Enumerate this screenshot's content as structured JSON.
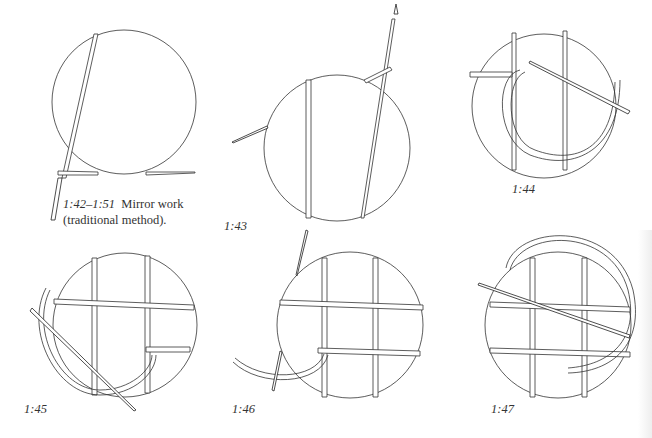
{
  "caption": {
    "figure_range": "1:42–1:51",
    "title_line1": "Mirror work",
    "title_line2": "(traditional method)."
  },
  "figures": [
    {
      "id": "1:42",
      "label": ""
    },
    {
      "id": "1:43",
      "label": "1:43"
    },
    {
      "id": "1:44",
      "label": "1:44"
    },
    {
      "id": "1:45",
      "label": "1:45"
    },
    {
      "id": "1:46",
      "label": "1:46"
    },
    {
      "id": "1:47",
      "label": "1:47"
    }
  ],
  "colors": {
    "paper": "#ffffff",
    "ink": "#333333"
  }
}
